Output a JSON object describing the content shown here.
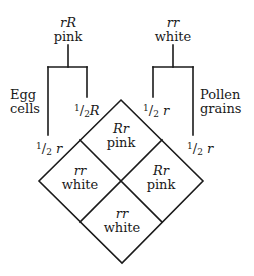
{
  "diagram": {
    "type": "punnett-square-diamond",
    "line_color": "#1a1a1a",
    "parents": {
      "left": {
        "genotype": "rR",
        "phenotype": "pink"
      },
      "right": {
        "genotype": "rr",
        "phenotype": "white"
      }
    },
    "side_labels": {
      "left": [
        "Egg",
        "cells"
      ],
      "right": [
        "Pollen",
        "grains"
      ]
    },
    "gametes": {
      "left_outer": {
        "fraction_num": "1",
        "fraction_den": "2",
        "allele": "r"
      },
      "left_inner": {
        "fraction_num": "1",
        "fraction_den": "2",
        "allele": "R"
      },
      "right_inner": {
        "fraction_num": "1",
        "fraction_den": "2",
        "allele": "r"
      },
      "right_outer": {
        "fraction_num": "1",
        "fraction_den": "2",
        "allele": "r"
      }
    },
    "cells": {
      "top": {
        "genotype": "Rr",
        "phenotype": "pink"
      },
      "left": {
        "genotype": "rr",
        "phenotype": "white"
      },
      "right": {
        "genotype": "Rr",
        "phenotype": "pink"
      },
      "bottom": {
        "genotype": "rr",
        "phenotype": "white"
      }
    }
  }
}
